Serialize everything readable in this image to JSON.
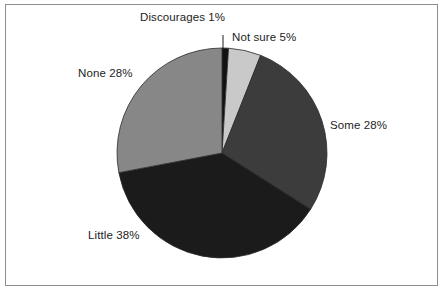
{
  "figure": {
    "background_color": "#ffffff",
    "frame_color": "#8e8e8e",
    "text_color": "#1d1d1d"
  },
  "chart_data": {
    "type": "pie",
    "title": "",
    "subtitle": "",
    "xlabel": "",
    "ylabel": "",
    "grid": false,
    "legend_position": "none",
    "labels_position": "outside-with-leader",
    "start_angle_deg": 0,
    "direction": "clockwise",
    "center": {
      "x": 222,
      "y": 153
    },
    "radius": 105,
    "categories": [
      "Discourages",
      "Not sure",
      "Some",
      "Little",
      "None"
    ],
    "values": [
      1,
      5,
      28,
      38,
      28
    ],
    "units": "percent",
    "slices": [
      {
        "name": "Discourages",
        "value": 1,
        "value_label": "1%",
        "label": "Discourages 1%",
        "color": "#111111",
        "start_deg": 0,
        "end_deg": 3.6,
        "has_leader_line": true
      },
      {
        "name": "Not sure",
        "value": 5,
        "value_label": "5%",
        "label": "Not sure 5%",
        "color": "#c9c9c9",
        "start_deg": 3.6,
        "end_deg": 21.6,
        "has_leader_line": false
      },
      {
        "name": "Some",
        "value": 28,
        "value_label": "28%",
        "label": "Some 28%",
        "color": "#3c3c3c",
        "start_deg": 21.6,
        "end_deg": 122.4,
        "has_leader_line": false
      },
      {
        "name": "Little",
        "value": 38,
        "value_label": "38%",
        "label": "Little 38%",
        "color": "#1b1b1b",
        "start_deg": 122.4,
        "end_deg": 259.2,
        "has_leader_line": false
      },
      {
        "name": "None",
        "value": 28,
        "value_label": "28%",
        "label": "None 28%",
        "color": "#878787",
        "start_deg": 259.2,
        "end_deg": 360,
        "has_leader_line": false
      }
    ]
  },
  "labels": {
    "discourages": {
      "name": "Discourages",
      "percent": "1%",
      "text": "Discourages 1%"
    },
    "notsure": {
      "name": "Not sure",
      "percent": "5%",
      "text": "Not sure 5%"
    },
    "some": {
      "name": "Some",
      "percent": "28%",
      "text": "Some 28%"
    },
    "little": {
      "name": "Little",
      "percent": "38%",
      "text": "Little 38%"
    },
    "none": {
      "name": "None",
      "percent": "28%",
      "text": "None 28%"
    }
  }
}
